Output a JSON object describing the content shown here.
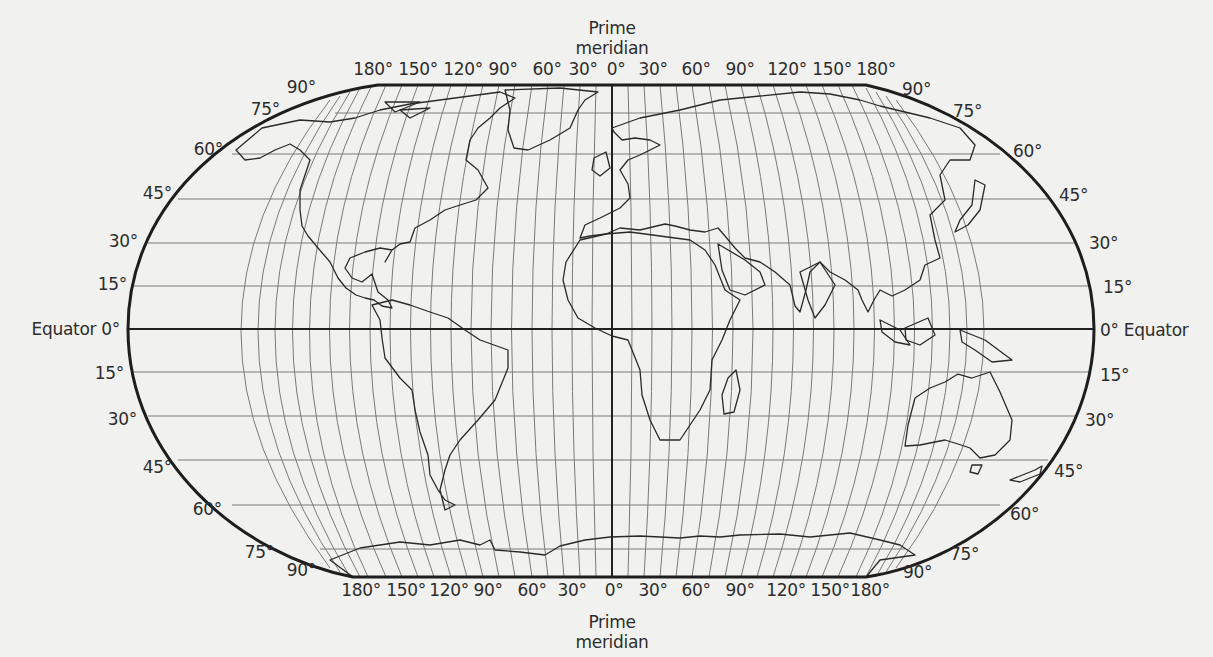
{
  "map": {
    "type": "world outline map",
    "projection": "Robinson",
    "title_partial": "",
    "prime_meridian_label": [
      "Prime",
      "meridian"
    ],
    "equator_label_left": "Equator 0°",
    "equator_label_right": "0° Equator",
    "top_longitude_labels": [
      "180°",
      "150°",
      "120°",
      "90°",
      "60°",
      "30°",
      "0°",
      "30°",
      "60°",
      "90°",
      "120°",
      "150°",
      "180°"
    ],
    "bottom_longitude_labels": [
      "180°",
      "150°",
      "120°",
      "90°",
      "60°",
      "30°",
      "0°",
      "30°",
      "60°",
      "90°",
      "120°",
      "150°",
      "180°"
    ],
    "left_latitude_labels_north": [
      "90°",
      "75°",
      "60°",
      "45°",
      "30°",
      "15°"
    ],
    "left_latitude_labels_south": [
      "15°",
      "30°",
      "45°",
      "60°",
      "75°",
      "90°"
    ],
    "right_latitude_labels_north": [
      "90°",
      "75°",
      "60°",
      "45°",
      "30°",
      "15°"
    ],
    "right_latitude_labels_south": [
      "15°",
      "30°",
      "45°",
      "60°",
      "75°",
      "90°"
    ],
    "graticule": {
      "meridian_step_deg": 15,
      "parallel_step_deg": 15
    },
    "colors": {
      "background": "#f1f1ef",
      "line": "#2a2a2a",
      "grid": "#6e6e6e"
    },
    "continents": [
      "North America",
      "South America",
      "Europe",
      "Africa",
      "Asia",
      "Australia",
      "Antarctica",
      "Greenland"
    ]
  }
}
